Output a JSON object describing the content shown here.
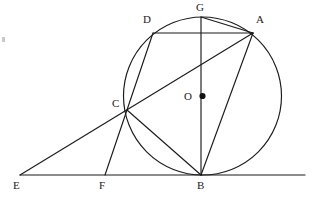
{
  "figure": {
    "width": 314,
    "height": 198,
    "background_color": "#ffffff",
    "stroke_color": "#1b1b1b"
  },
  "labels": {
    "A": "A",
    "B": "B",
    "C": "C",
    "D": "D",
    "E": "E",
    "F": "F",
    "G": "G",
    "O": "O"
  },
  "geometry": {
    "circle": {
      "cx": 202.5,
      "cy": 96,
      "r": 79
    },
    "points": {
      "A": {
        "x": 253,
        "y": 33
      },
      "B": {
        "x": 201,
        "y": 175
      },
      "C": {
        "x": 127,
        "y": 110
      },
      "D": {
        "x": 153,
        "y": 33
      },
      "E": {
        "x": 20,
        "y": 175
      },
      "F": {
        "x": 105,
        "y": 175
      },
      "G": {
        "x": 201,
        "y": 17
      },
      "O": {
        "x": 202.5,
        "y": 96
      }
    },
    "label_positions": {
      "A": {
        "x": 256,
        "y": 14
      },
      "B": {
        "x": 197,
        "y": 180
      },
      "C": {
        "x": 112,
        "y": 98
      },
      "D": {
        "x": 143,
        "y": 14
      },
      "E": {
        "x": 13,
        "y": 180
      },
      "F": {
        "x": 99,
        "y": 180
      },
      "G": {
        "x": 196,
        "y": 2
      },
      "O": {
        "x": 184,
        "y": 91
      }
    },
    "segments": [
      {
        "name": "tangent-line-EB",
        "from": [
          20,
          175
        ],
        "to": [
          305,
          175
        ]
      },
      {
        "name": "secant-line-EA",
        "from": [
          20,
          175
        ],
        "to": [
          253,
          33
        ]
      },
      {
        "name": "chord-DA",
        "from": [
          153,
          33
        ],
        "to": [
          253,
          33
        ]
      },
      {
        "name": "chord-GA",
        "from": [
          201,
          17
        ],
        "to": [
          253,
          33
        ]
      },
      {
        "name": "diameter-GB",
        "from": [
          201,
          17
        ],
        "to": [
          201,
          175
        ]
      },
      {
        "name": "chord-DC-extended-F",
        "from": [
          153,
          33
        ],
        "to": [
          105,
          175
        ]
      },
      {
        "name": "chord-CB",
        "from": [
          127,
          110
        ],
        "to": [
          201,
          175
        ]
      },
      {
        "name": "chord-AB",
        "from": [
          253,
          33
        ],
        "to": [
          201,
          175
        ]
      }
    ]
  }
}
